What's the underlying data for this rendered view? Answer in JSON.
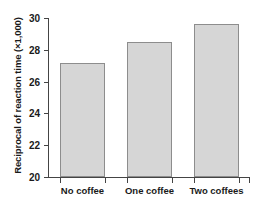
{
  "chart_data": {
    "type": "bar",
    "title": "",
    "subtitle": "",
    "xlabel": "",
    "ylabel": "Reciprocal of reaction time (×1,000)",
    "categories": [
      "No coffee",
      "One coffee",
      "Two coffees"
    ],
    "values": [
      27.2,
      28.5,
      29.6
    ],
    "ylim": [
      20,
      30
    ],
    "yticks": [
      20,
      22,
      24,
      26,
      28,
      30
    ],
    "ytick_labels": [
      "20",
      "22",
      "24",
      "26",
      "28",
      "30"
    ],
    "grid": false,
    "legend": false,
    "legend_position": "none",
    "bar_fill_color": "#d6d6d6",
    "bar_edge_color": "#8d8d8d",
    "axis_color": "#444444",
    "text_color": "#1a1a1a",
    "annotations": []
  }
}
